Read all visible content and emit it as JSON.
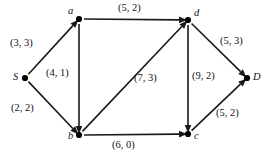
{
  "figure": {
    "kind": "directed-flow-network-diagram",
    "width": 275,
    "height": 159,
    "background_color": "#ffffff",
    "ink_color": "#111111"
  },
  "nodes": [
    {
      "id": "S",
      "label": "S",
      "x": 25,
      "y": 78,
      "label_dx": -12,
      "label_dy": -6
    },
    {
      "id": "a",
      "label": "a",
      "x": 79,
      "y": 19,
      "label_dx": -11,
      "label_dy": -13
    },
    {
      "id": "b",
      "label": "b",
      "x": 79,
      "y": 135,
      "label_dx": -11,
      "label_dy": -4
    },
    {
      "id": "c",
      "label": "c",
      "x": 188,
      "y": 134,
      "label_dx": 6,
      "label_dy": -3
    },
    {
      "id": "d",
      "label": "d",
      "x": 188,
      "y": 20,
      "label_dx": 6,
      "label_dy": -12
    },
    {
      "id": "D",
      "label": "D",
      "x": 247,
      "y": 78,
      "label_dx": 6,
      "label_dy": -6
    }
  ],
  "edges": [
    {
      "id": "S-a",
      "from": "S",
      "to": "a",
      "capacity": 3,
      "flow": 3,
      "label": "(3, 3)",
      "label_x": 10,
      "label_y": 38
    },
    {
      "id": "S-b",
      "from": "S",
      "to": "b",
      "capacity": 2,
      "flow": 2,
      "label": "(2, 2)",
      "label_x": 11,
      "label_y": 103
    },
    {
      "id": "a-d",
      "from": "a",
      "to": "d",
      "capacity": 5,
      "flow": 2,
      "label": "(5, 2)",
      "label_x": 118,
      "label_y": 3
    },
    {
      "id": "a-b",
      "from": "a",
      "to": "b",
      "capacity": 4,
      "flow": 1,
      "label": "(4, 1)",
      "label_x": 46,
      "label_y": 68
    },
    {
      "id": "b-d",
      "from": "b",
      "to": "d",
      "capacity": 7,
      "flow": 3,
      "label": "(7, 3)",
      "label_x": 134,
      "label_y": 73
    },
    {
      "id": "b-c",
      "from": "b",
      "to": "c",
      "capacity": 6,
      "flow": 0,
      "label": "(6, 0)",
      "label_x": 112,
      "label_y": 140
    },
    {
      "id": "d-c",
      "from": "d",
      "to": "c",
      "capacity": 9,
      "flow": 2,
      "label": "(9, 2)",
      "label_x": 192,
      "label_y": 71
    },
    {
      "id": "d-D",
      "from": "d",
      "to": "D",
      "capacity": 5,
      "flow": 3,
      "label": "(5, 3)",
      "label_x": 220,
      "label_y": 36
    },
    {
      "id": "c-D",
      "from": "c",
      "to": "D",
      "capacity": 5,
      "flow": 2,
      "label": "(5, 2)",
      "label_x": 216,
      "label_y": 108
    }
  ]
}
